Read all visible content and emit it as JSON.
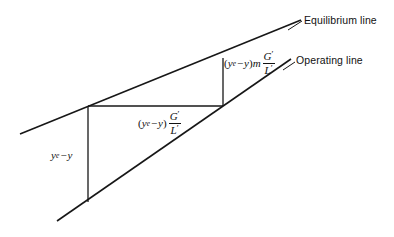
{
  "figure": {
    "background_color": "#ffffff",
    "line_color": "#171717"
  },
  "labels": {
    "equilibrium_line": "Equilibrium line",
    "operating_line": "Operating line",
    "vertical_driving_force": {
      "text": "y_e - y",
      "var": "y",
      "subscript": "e",
      "minus": "−",
      "second_var": "y"
    },
    "horizontal_segment": {
      "text": "(y_e - y) G'/L'",
      "open_paren": "(",
      "var": "y",
      "subscript": "e",
      "minus": "−",
      "second_var": "y",
      "close_paren": ")",
      "numerator": "G",
      "numerator_prime": "′",
      "denominator": "L",
      "denominator_prime": "′"
    },
    "slanted_segment": {
      "text": "(y_e - y)m G'/L'",
      "open_paren": "(",
      "var": "y",
      "subscript": "e",
      "minus": "−",
      "second_var": "y",
      "close_paren": ")",
      "slope": "m",
      "numerator": "G",
      "numerator_prime": "′",
      "denominator": "L",
      "denominator_prime": "′"
    }
  },
  "geometry": {
    "equilibrium_line": {
      "x1": 20,
      "y1": 134,
      "x2": 301,
      "y2": 20,
      "width": 1.6
    },
    "operating_line": {
      "x1": 57,
      "y1": 221,
      "x2": 291,
      "y2": 59,
      "width": 1.6
    },
    "vertical_driving": {
      "x1": 88,
      "y1": 106,
      "x2": 88,
      "y2": 202,
      "width": 1.3
    },
    "horizontal_step": {
      "x1": 88,
      "y1": 106,
      "x2": 223,
      "y2": 106,
      "width": 1.3
    },
    "vertical_step": {
      "x1": 223,
      "y1": 58,
      "x2": 223,
      "y2": 106,
      "width": 1.3
    },
    "equilibrium_leader": {
      "x1": 288,
      "y1": 30,
      "x2": 302,
      "y2": 21
    },
    "operating_leader": {
      "x1": 283,
      "y1": 70,
      "x2": 295,
      "y2": 62
    }
  }
}
